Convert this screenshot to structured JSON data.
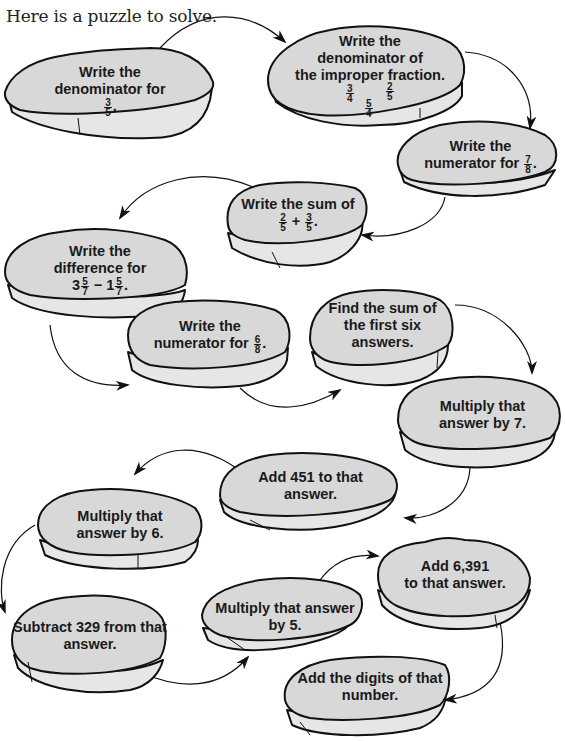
{
  "intro": "Here is a puzzle to solve.",
  "colors": {
    "stone_top": "#d8d8d8",
    "stone_side": "#e6e6e6",
    "outline": "#111111",
    "text": "#1a1a1a"
  },
  "stones": [
    {
      "id": 1,
      "line1": "Write the",
      "line2": "denominator for",
      "frac": {
        "num": "3",
        "den": "5"
      },
      "suffix": "."
    },
    {
      "id": 2,
      "line1": "Write the",
      "line2": "denominator of",
      "line3": "the improper fraction.",
      "options": [
        {
          "num": "3",
          "den": "4"
        },
        {
          "num": "5",
          "den": "4"
        },
        {
          "num": "2",
          "den": "5"
        }
      ]
    },
    {
      "id": 3,
      "line1": "Write the",
      "line2": "numerator for",
      "frac": {
        "num": "7",
        "den": "8"
      },
      "suffix": "."
    },
    {
      "id": 4,
      "line1": "Write the sum of",
      "a": {
        "num": "2",
        "den": "5"
      },
      "op": "+",
      "b": {
        "num": "3",
        "den": "5"
      },
      "suffix": "."
    },
    {
      "id": 5,
      "line1": "Write the",
      "line2": "difference for",
      "a_whole": "3",
      "a": {
        "num": "5",
        "den": "7"
      },
      "op": "−",
      "b_whole": "1",
      "b": {
        "num": "5",
        "den": "7"
      },
      "suffix": "."
    },
    {
      "id": 6,
      "line1": "Write the",
      "line2": "numerator for",
      "frac": {
        "num": "6",
        "den": "8"
      },
      "suffix": "."
    },
    {
      "id": 7,
      "line1": "Find the sum of",
      "line2": "the first six",
      "line3": "answers."
    },
    {
      "id": 8,
      "line1": "Multiply that",
      "line2": "answer by 7."
    },
    {
      "id": 9,
      "line1": "Add 451 to that",
      "line2": "answer."
    },
    {
      "id": 10,
      "line1": "Multiply that",
      "line2": "answer by 6."
    },
    {
      "id": 11,
      "line1": "Subtract 329 from that",
      "line2": "answer."
    },
    {
      "id": 12,
      "line1": "Multiply that answer",
      "line2": "by 5."
    },
    {
      "id": 13,
      "line1": "Add 6,391",
      "line2": "to that answer."
    },
    {
      "id": 14,
      "line1": "Add the digits of that",
      "line2": "number."
    }
  ]
}
